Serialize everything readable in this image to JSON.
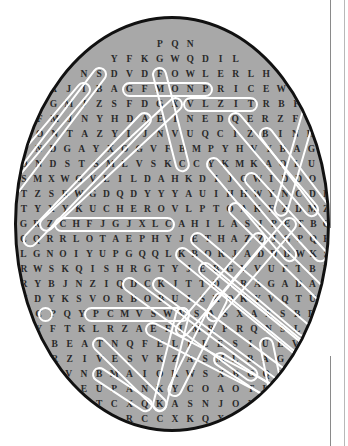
{
  "page": {
    "type": "word-search-puzzle",
    "background_color": "#ffffff",
    "circle_fill": "#a8a8a8",
    "circle_border": "#111111",
    "letter_color": "#2a2a2a",
    "highlight_color": "#ffffff"
  },
  "grid": {
    "shape": "circle",
    "rows": 27,
    "letters": [
      "P Q N",
      "Y F K G W Q D I L",
      "N S D V D F O W L E R L H",
      "A J I B A G F M O N P R I C E W P",
      "D G M J Z S F D G X V L Z I T R B F Y",
      "R F M J N Y H D A E I N E D Q E R Z F T H",
      "A O N T A Z Y L J N V U Q C I Z B I N H K",
      "J N D G A Y X O G V F B M P Y H V Y B A G C",
      "D N D S T S M L V S K C C Y K M K A O L U Y",
      "S M X W G V L I L D A H K D I J C W I D D O T",
      "T Z S R W G D Q D Y Y Y A U I H H W Y N C D F",
      "T Y X Y K U C H E R O V L P T O A K F Z D M Z",
      "G R Z C H F J G J X L C A H I L A S I P E T B Q",
      "C Q R R L O T A E P H Y J E T H A Z Z J G P Q E",
      "L G N O I Y U P G Q Q L K B O R J A D D D W K S",
      "R W S K Q I S H R G T Y J E B G V V U F T B B",
      "R Y B J N Z I Q D C K J T T D I R A G A D A E",
      "V D Y K S V O R B O B U I S K O K Y V Q T U X",
      "D C P Q Y P C M V S W V S A S X A X S B D L",
      "S Y F T K L R Z A E F L M R P R Q N S L D C",
      "Z Q B E A T N Q F E L F L E S I U E V U S",
      "F U R Z I V E S V K Z A S M L B A G H Y D",
      "J Z V N B M A I O K W S X B G Q P G G",
      "I W E U P A N K Y C O A O T K I F",
      "G T C X Q K A S N J O P U",
      "P R C C X K Q X K",
      "W Y N"
    ]
  },
  "found_words": [
    {
      "word": "FOWLER",
      "direction": "horizontal",
      "row": 3,
      "start_col": 5
    },
    {
      "word": "PRICE",
      "direction": "horizontal",
      "row": 4,
      "start_col": 10
    },
    {
      "word": "KUCHEROV",
      "direction": "horizontal",
      "row": 12,
      "start_col": 4
    },
    {
      "word": "VORBOBU",
      "direction": "horizontal",
      "row": 18,
      "start_col": 5
    }
  ],
  "highlights": {
    "count": 18,
    "style": "white rounded outline",
    "orientations": [
      "horizontal",
      "vertical",
      "diagonal-down-right",
      "diagonal-down-left"
    ]
  },
  "binding": {
    "color": "#8a8a8a",
    "description": "page binding rule at right edge"
  }
}
